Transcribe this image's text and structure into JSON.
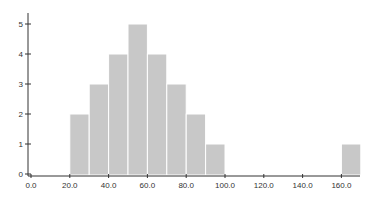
{
  "chart_data": {
    "type": "bar",
    "subtype": "histogram",
    "title": "",
    "xlabel": "",
    "ylabel": "",
    "bins": [
      {
        "start": 20,
        "end": 30,
        "count": 2
      },
      {
        "start": 30,
        "end": 40,
        "count": 3
      },
      {
        "start": 40,
        "end": 50,
        "count": 4
      },
      {
        "start": 50,
        "end": 60,
        "count": 5
      },
      {
        "start": 60,
        "end": 70,
        "count": 4
      },
      {
        "start": 70,
        "end": 80,
        "count": 3
      },
      {
        "start": 80,
        "end": 90,
        "count": 2
      },
      {
        "start": 90,
        "end": 100,
        "count": 1
      },
      {
        "start": 160,
        "end": 170,
        "count": 1
      }
    ],
    "categories": [
      "20-30",
      "30-40",
      "40-50",
      "50-60",
      "60-70",
      "70-80",
      "80-90",
      "90-100",
      "160-170"
    ],
    "values": [
      2,
      3,
      4,
      5,
      4,
      3,
      2,
      1,
      1
    ],
    "xlim": [
      0,
      170
    ],
    "ylim": [
      0,
      5
    ],
    "x_ticks": [
      "0.0",
      "20.0",
      "40.0",
      "60.0",
      "80.0",
      "100.0",
      "120.0",
      "140.0",
      "160.0"
    ],
    "x_tick_values": [
      0,
      20,
      40,
      60,
      80,
      100,
      120,
      140,
      160
    ],
    "y_ticks": [
      "0",
      "1",
      "2",
      "3",
      "4",
      "5"
    ],
    "y_tick_values": [
      0,
      1,
      2,
      3,
      4,
      5
    ],
    "grid": false,
    "legend": null,
    "bar_color": "#c8c8c8"
  }
}
